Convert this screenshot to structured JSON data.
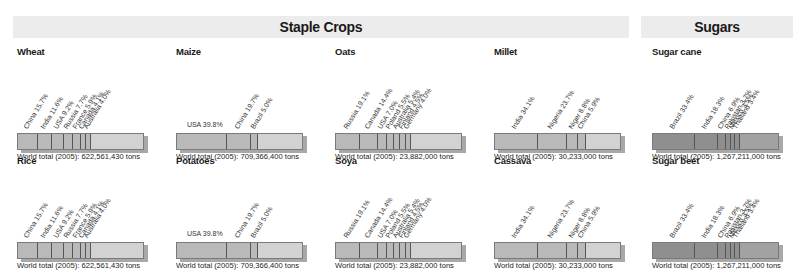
{
  "headers": {
    "staple": "Staple Crops",
    "sugars": "Sugars"
  },
  "chart_data": [
    {
      "type": "bar",
      "title": "Wheat",
      "orientation": "stacked-horizontal",
      "categories": [
        "China",
        "India",
        "USA",
        "Russia",
        "France",
        "Canada",
        "Australia"
      ],
      "values": [
        15.7,
        11.6,
        9.2,
        7.7,
        5.9,
        4.1,
        4.0
      ],
      "unit": "%",
      "total": "World total (2005): 622,561,430 tons"
    },
    {
      "type": "bar",
      "title": "Maize",
      "orientation": "stacked-horizontal",
      "categories": [
        "USA",
        "China",
        "Brazil"
      ],
      "values": [
        39.8,
        19.7,
        5.0
      ],
      "unit": "%",
      "total": "World total (2005): 709,366,400 tons"
    },
    {
      "type": "bar",
      "title": "Oats",
      "orientation": "stacked-horizontal",
      "categories": [
        "Russia",
        "Canada",
        "USA",
        "Poland",
        "Australia",
        "Finland",
        "Germany"
      ],
      "values": [
        19.1,
        14.4,
        7.0,
        5.5,
        5.4,
        4.5,
        4.0
      ],
      "unit": "%",
      "total": "World total (2005): 23,882,000 tons"
    },
    {
      "type": "bar",
      "title": "Millet",
      "orientation": "stacked-horizontal",
      "categories": [
        "India",
        "Nigeria",
        "Niger",
        "China"
      ],
      "values": [
        34.1,
        23.7,
        8.8,
        5.9
      ],
      "unit": "%",
      "total": "World total (2005): 30,233,000 tons"
    },
    {
      "type": "bar",
      "title": "Sugar cane",
      "orientation": "stacked-horizontal",
      "categories": [
        "Brazil",
        "India",
        "China",
        "Pakistan",
        "Mexico",
        "Thailand"
      ],
      "values": [
        33.4,
        18.3,
        6.9,
        3.7,
        3.5,
        3.4
      ],
      "unit": "%",
      "total": "World total (2005): 1,267,211,000 tons"
    },
    {
      "type": "bar",
      "title": "Rice",
      "orientation": "stacked-horizontal",
      "categories": [
        "China",
        "India",
        "USA",
        "Russia",
        "France",
        "Canada",
        "Australia"
      ],
      "values": [
        15.7,
        11.6,
        9.2,
        7.7,
        5.9,
        4.1,
        4.0
      ],
      "unit": "%",
      "total": "World total (2005): 622,561,430 tons"
    },
    {
      "type": "bar",
      "title": "Potatoes",
      "orientation": "stacked-horizontal",
      "categories": [
        "USA",
        "China",
        "Brazil"
      ],
      "values": [
        39.8,
        19.7,
        5.0
      ],
      "unit": "%",
      "total": "World total (2005): 709,366,400 tons"
    },
    {
      "type": "bar",
      "title": "Soya",
      "orientation": "stacked-horizontal",
      "categories": [
        "Russia",
        "Canada",
        "USA",
        "Poland",
        "Australia",
        "Finland",
        "Germany"
      ],
      "values": [
        19.1,
        14.4,
        7.0,
        5.5,
        5.4,
        4.5,
        4.0
      ],
      "unit": "%",
      "total": "World total (2005): 23,882,000 tons"
    },
    {
      "type": "bar",
      "title": "Cassava",
      "orientation": "stacked-horizontal",
      "categories": [
        "India",
        "Nigeria",
        "Niger",
        "China"
      ],
      "values": [
        34.1,
        23.7,
        8.8,
        5.9
      ],
      "unit": "%",
      "total": "World total (2005): 30,233,000 tons"
    },
    {
      "type": "bar",
      "title": "Sugar beet",
      "orientation": "stacked-horizontal",
      "categories": [
        "Brazil",
        "India",
        "China",
        "Pakistan",
        "Mexico",
        "Thailand"
      ],
      "values": [
        33.4,
        18.3,
        6.9,
        3.7,
        3.5,
        3.4
      ],
      "unit": "%",
      "total": "World total (2005): 1,267,211,000 tons"
    }
  ],
  "panels": [
    {
      "title": "Wheat",
      "left": 13,
      "top": 46,
      "dark": false,
      "flat_first": false,
      "labels": [
        "China 15.7%",
        "India 11.6%",
        "USA 9.2%",
        "Russia 7.7%",
        "France 5.9%",
        "Canada 4.1%",
        "Australia 4.0%"
      ],
      "values": [
        15.7,
        11.6,
        9.2,
        7.7,
        5.9,
        4.1,
        4.0
      ],
      "total": "World total (2005): 622,561,430 tons"
    },
    {
      "title": "Maize",
      "left": 172,
      "top": 46,
      "dark": false,
      "flat_first": true,
      "labels": [
        "USA 39.8%",
        "China 19.7%",
        "Brazil 5.0%"
      ],
      "values": [
        39.8,
        19.7,
        5.0
      ],
      "total": "World total (2005): 709,366,400 tons"
    },
    {
      "title": "Oats",
      "left": 331,
      "top": 46,
      "dark": false,
      "flat_first": false,
      "labels": [
        "Russia 19.1%",
        "Canada 14.4%",
        "USA 7.0%",
        "Poland 5.5%",
        "Australia 5.4%",
        "Finland 4.5%",
        "Germany 4.0%"
      ],
      "values": [
        19.1,
        14.4,
        7.0,
        5.5,
        5.4,
        4.5,
        4.0
      ],
      "total": "World total (2005): 23,882,000 tons"
    },
    {
      "title": "Millet",
      "left": 490,
      "top": 46,
      "dark": false,
      "flat_first": false,
      "labels": [
        "India 34.1%",
        "Nigeria 23.7%",
        "Niger 8.8%",
        "China 5.9%"
      ],
      "values": [
        34.1,
        23.7,
        8.8,
        5.9
      ],
      "total": "World total (2005): 30,233,000 tons"
    },
    {
      "title": "Sugar cane",
      "left": 648,
      "top": 46,
      "dark": true,
      "flat_first": false,
      "labels": [
        "Brazil 33.4%",
        "India 18.3%",
        "China 6.9%",
        "Pakistan 3.7%",
        "Mexico 3.5%",
        "Thailand 3.4%"
      ],
      "values": [
        33.4,
        18.3,
        6.9,
        3.7,
        3.5,
        3.4
      ],
      "total": "World total (2005): 1,267,211,000 tons"
    },
    {
      "title": "Rice",
      "left": 13,
      "top": 155,
      "dark": false,
      "flat_first": false,
      "labels": [
        "China 15.7%",
        "India 11.6%",
        "USA 9.2%",
        "Russia 7.7%",
        "France 5.9%",
        "Canada 4.1%",
        "Australia 4.0%"
      ],
      "values": [
        15.7,
        11.6,
        9.2,
        7.7,
        5.9,
        4.1,
        4.0
      ],
      "total": "World total (2005): 622,561,430 tons"
    },
    {
      "title": "Potatoes",
      "left": 172,
      "top": 155,
      "dark": false,
      "flat_first": true,
      "labels": [
        "USA 39.8%",
        "China 19.7%",
        "Brazil 5.0%"
      ],
      "values": [
        39.8,
        19.7,
        5.0
      ],
      "total": "World total (2005): 709,366,400 tons"
    },
    {
      "title": "Soya",
      "left": 331,
      "top": 155,
      "dark": false,
      "flat_first": false,
      "labels": [
        "Russia 19.1%",
        "Canada 14.4%",
        "USA 7.0%",
        "Poland 5.5%",
        "Australia 5.4%",
        "Finland 4.5%",
        "Germany 4.0%"
      ],
      "values": [
        19.1,
        14.4,
        7.0,
        5.5,
        5.4,
        4.5,
        4.0
      ],
      "total": "World total (2005): 23,882,000 tons"
    },
    {
      "title": "Cassava",
      "left": 490,
      "top": 155,
      "dark": false,
      "flat_first": false,
      "labels": [
        "India 34.1%",
        "Nigeria 23.7%",
        "Niger 8.8%",
        "China 5.9%"
      ],
      "values": [
        34.1,
        23.7,
        8.8,
        5.9
      ],
      "total": "World total (2005): 30,233,000 tons"
    },
    {
      "title": "Sugar beet",
      "left": 648,
      "top": 155,
      "dark": true,
      "flat_first": false,
      "labels": [
        "Brazil 33.4%",
        "India 18.3%",
        "China 6.9%",
        "Pakistan 3.7%",
        "Mexico 3.5%",
        "Thailand 3.4%"
      ],
      "values": [
        33.4,
        18.3,
        6.9,
        3.7,
        3.5,
        3.4
      ],
      "total": "World total (2005): 1,267,211,000 tons"
    }
  ]
}
